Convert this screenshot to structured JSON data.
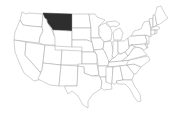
{
  "map": {
    "title": "United States map",
    "highlighted_state": "Montana",
    "colors": {
      "highlight": "#2e2e2e",
      "fill": "#ffffff",
      "border": "#9a9a9a",
      "background": "#ffffff"
    }
  }
}
